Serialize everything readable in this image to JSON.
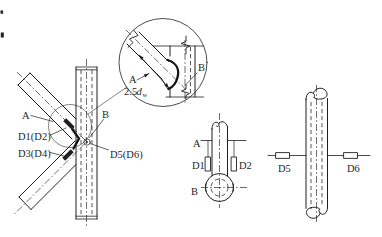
{
  "meta": {
    "background_color": "#ffffff",
    "ink_color": "#1f1f1f"
  },
  "left_view": {
    "label_a": "A",
    "label_b": "B",
    "gauge_d1d2": "D1(D2)",
    "gauge_d3d4": "D3(D4)",
    "gauge_d5d6": "D5(D6)"
  },
  "detail_view": {
    "label_a": "A",
    "label_b": "B",
    "dimension": {
      "prefix": "2.5",
      "symbol": "d",
      "subscript": "w"
    }
  },
  "brace_view": {
    "label_a": "A",
    "label_b": "B",
    "gauge_d1": "D1",
    "gauge_d2": "D2"
  },
  "chord_view": {
    "gauge_d5": "D5",
    "gauge_d6": "D6"
  }
}
